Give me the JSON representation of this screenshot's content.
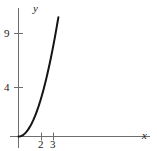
{
  "figure": {
    "background_color": "#ffffff",
    "ink_color": "#1a1a1a",
    "axis_color": "#6e6e6e",
    "curve_color": "#141414"
  },
  "axes": {
    "x_label": "x",
    "y_label": "y"
  },
  "chart_data": {
    "type": "line",
    "title": "",
    "subtitle": "",
    "xlabel": "x",
    "ylabel": "y",
    "grid": false,
    "legend": null,
    "xlim": [
      0,
      4.0
    ],
    "ylim": [
      0,
      11.5
    ],
    "x_ticks": [
      2,
      3
    ],
    "x_tick_labels": [
      "2",
      "3"
    ],
    "y_ticks": [
      4,
      9
    ],
    "y_tick_labels": [
      "4",
      "9"
    ],
    "series": [
      {
        "name": "y = x^2",
        "x": [
          0,
          0.25,
          0.5,
          0.75,
          1.0,
          1.25,
          1.5,
          1.75,
          2.0,
          2.25,
          2.5,
          2.75,
          3.0,
          3.25,
          3.35
        ],
        "y": [
          0,
          0.06,
          0.25,
          0.56,
          1.0,
          1.56,
          2.25,
          3.06,
          4.0,
          5.06,
          6.25,
          7.56,
          9.0,
          10.56,
          11.22
        ]
      }
    ],
    "annotations": []
  }
}
